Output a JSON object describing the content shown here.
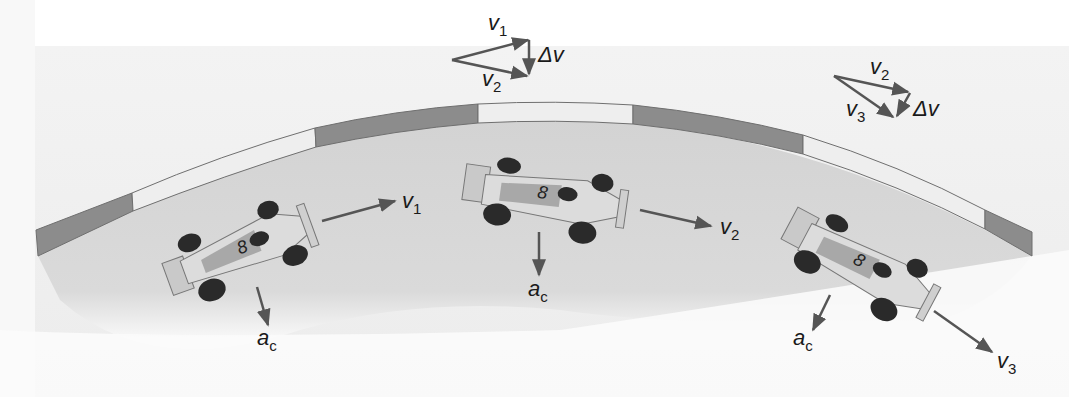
{
  "figure": {
    "colors": {
      "panel": "#e4e4e4",
      "panel_light": "#f4f4f4",
      "track": "#d2d2d2",
      "wall_dark": "#8c8c8c",
      "wall_light": "#eeeeee",
      "wall_edge": "#6f6f6f",
      "arrow": "#5a5a5a",
      "car_body": "#dcdcdc",
      "car_shade": "#a8a8a8",
      "tire": "#2a2a2a"
    },
    "cars": [
      {
        "id": "car-1",
        "number": "8",
        "velocity_label": {
          "main": "v",
          "sub": "1"
        },
        "acceleration_label": {
          "main": "a",
          "sub": "c"
        }
      },
      {
        "id": "car-2",
        "number": "8",
        "velocity_label": {
          "main": "v",
          "sub": "2"
        },
        "acceleration_label": {
          "main": "a",
          "sub": "c"
        }
      },
      {
        "id": "car-3",
        "number": "8",
        "velocity_label": {
          "main": "v",
          "sub": "3"
        },
        "acceleration_label": {
          "main": "a",
          "sub": "c"
        }
      }
    ],
    "vector_triangles": [
      {
        "id": "triangle-1",
        "first": {
          "main": "v",
          "sub": "1"
        },
        "second": {
          "main": "v",
          "sub": "2"
        },
        "difference": "Δv"
      },
      {
        "id": "triangle-2",
        "first": {
          "main": "v",
          "sub": "2"
        },
        "second": {
          "main": "v",
          "sub": "3"
        },
        "difference": "Δv"
      }
    ]
  }
}
